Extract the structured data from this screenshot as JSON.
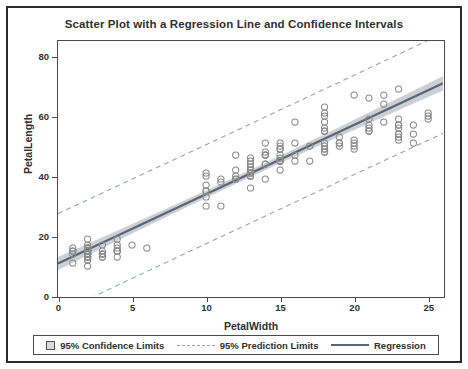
{
  "figure": {
    "background": "#ffffff",
    "border_color": "#2b2b2b"
  },
  "chart_data": {
    "type": "scatter",
    "title": "Scatter Plot with a Regression Line and Confidence Intervals",
    "xlabel": "PetalWidth",
    "ylabel": "PetalLength",
    "xlim": [
      0,
      26
    ],
    "ylim": [
      0,
      85
    ],
    "xticks": [
      0,
      5,
      10,
      15,
      20,
      25
    ],
    "yticks": [
      0,
      20,
      40,
      60,
      80
    ],
    "grid": false,
    "legend_position": "bottom",
    "colors": {
      "marker": "#8c8c8c",
      "regression": "#5b6573",
      "confidence_band": "#c9ced4",
      "prediction_limits": "#9aa3ae",
      "axis": "#4a4a4a",
      "text": "#303030"
    },
    "marker_style": "open-circle",
    "regression": {
      "intercept": 10.84,
      "slope": 2.31,
      "label": "Regression"
    },
    "confidence_limits": {
      "level": "95%",
      "label": "95% Confidence Limits",
      "half_width_center": 1.1
    },
    "prediction_limits": {
      "level": "95%",
      "label": "95% Prediction Limits",
      "half_width_center": 16.5
    },
    "series": [
      {
        "name": "PetalLength vs PetalWidth",
        "points": [
          [
            2,
            14
          ],
          [
            2,
            14
          ],
          [
            2,
            13
          ],
          [
            2,
            15
          ],
          [
            2,
            14
          ],
          [
            4,
            17
          ],
          [
            3,
            14
          ],
          [
            2,
            15
          ],
          [
            2,
            14
          ],
          [
            1,
            15
          ],
          [
            2,
            15
          ],
          [
            2,
            16
          ],
          [
            1,
            14
          ],
          [
            1,
            11
          ],
          [
            2,
            12
          ],
          [
            4,
            15
          ],
          [
            4,
            13
          ],
          [
            3,
            14
          ],
          [
            3,
            17
          ],
          [
            3,
            15
          ],
          [
            2,
            17
          ],
          [
            4,
            15
          ],
          [
            2,
            10
          ],
          [
            5,
            17
          ],
          [
            2,
            19
          ],
          [
            2,
            16
          ],
          [
            4,
            16
          ],
          [
            2,
            15
          ],
          [
            2,
            14
          ],
          [
            2,
            16
          ],
          [
            2,
            16
          ],
          [
            4,
            15
          ],
          [
            1,
            16
          ],
          [
            2,
            15
          ],
          [
            2,
            15
          ],
          [
            2,
            12
          ],
          [
            2,
            13
          ],
          [
            1,
            15
          ],
          [
            2,
            13
          ],
          [
            2,
            15
          ],
          [
            3,
            13
          ],
          [
            3,
            13
          ],
          [
            2,
            13
          ],
          [
            6,
            16
          ],
          [
            4,
            19
          ],
          [
            3,
            14
          ],
          [
            2,
            16
          ],
          [
            2,
            14
          ],
          [
            2,
            15
          ],
          [
            2,
            14
          ],
          [
            14,
            47
          ],
          [
            15,
            45
          ],
          [
            15,
            49
          ],
          [
            13,
            40
          ],
          [
            15,
            46
          ],
          [
            13,
            45
          ],
          [
            16,
            47
          ],
          [
            10,
            33
          ],
          [
            13,
            46
          ],
          [
            14,
            39
          ],
          [
            10,
            35
          ],
          [
            15,
            42
          ],
          [
            10,
            40
          ],
          [
            14,
            47
          ],
          [
            13,
            36
          ],
          [
            14,
            44
          ],
          [
            15,
            45
          ],
          [
            10,
            41
          ],
          [
            15,
            45
          ],
          [
            11,
            39
          ],
          [
            18,
            48
          ],
          [
            13,
            40
          ],
          [
            15,
            49
          ],
          [
            12,
            47
          ],
          [
            13,
            43
          ],
          [
            14,
            44
          ],
          [
            14,
            48
          ],
          [
            17,
            50
          ],
          [
            15,
            45
          ],
          [
            10,
            35
          ],
          [
            11,
            38
          ],
          [
            10,
            37
          ],
          [
            12,
            39
          ],
          [
            16,
            51
          ],
          [
            15,
            45
          ],
          [
            16,
            45
          ],
          [
            15,
            47
          ],
          [
            13,
            44
          ],
          [
            13,
            41
          ],
          [
            13,
            40
          ],
          [
            12,
            42
          ],
          [
            14,
            47
          ],
          [
            12,
            39
          ],
          [
            10,
            30
          ],
          [
            13,
            41
          ],
          [
            12,
            40
          ],
          [
            13,
            42
          ],
          [
            13,
            42
          ],
          [
            11,
            30
          ],
          [
            13,
            41
          ],
          [
            25,
            60
          ],
          [
            19,
            51
          ],
          [
            21,
            59
          ],
          [
            18,
            56
          ],
          [
            22,
            58
          ],
          [
            21,
            66
          ],
          [
            17,
            45
          ],
          [
            18,
            63
          ],
          [
            18,
            58
          ],
          [
            25,
            61
          ],
          [
            20,
            51
          ],
          [
            19,
            53
          ],
          [
            21,
            55
          ],
          [
            20,
            50
          ],
          [
            24,
            51
          ],
          [
            23,
            53
          ],
          [
            18,
            55
          ],
          [
            22,
            67
          ],
          [
            23,
            69
          ],
          [
            15,
            50
          ],
          [
            23,
            57
          ],
          [
            20,
            49
          ],
          [
            20,
            67
          ],
          [
            18,
            49
          ],
          [
            21,
            57
          ],
          [
            18,
            60
          ],
          [
            18,
            48
          ],
          [
            18,
            49
          ],
          [
            21,
            56
          ],
          [
            16,
            58
          ],
          [
            18,
            61
          ],
          [
            22,
            64
          ],
          [
            23,
            56
          ],
          [
            15,
            51
          ],
          [
            14,
            51
          ],
          [
            23,
            59
          ],
          [
            24,
            57
          ],
          [
            18,
            55
          ],
          [
            18,
            50
          ],
          [
            21,
            55
          ],
          [
            24,
            54
          ],
          [
            23,
            54
          ],
          [
            19,
            51
          ],
          [
            23,
            57
          ],
          [
            25,
            59
          ],
          [
            23,
            52
          ],
          [
            19,
            50
          ],
          [
            20,
            52
          ],
          [
            23,
            54
          ],
          [
            18,
            51
          ]
        ]
      }
    ],
    "legend": [
      {
        "label": "95% Confidence Limits",
        "marker": "filled-box"
      },
      {
        "label": "95% Prediction Limits",
        "marker": "dashed-line"
      },
      {
        "label": "Regression",
        "marker": "solid-line"
      }
    ]
  }
}
